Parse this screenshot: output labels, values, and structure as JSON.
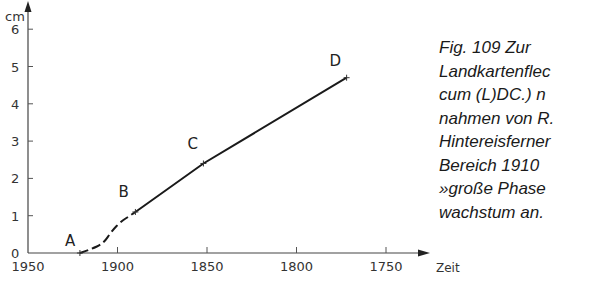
{
  "chart_data": {
    "type": "line",
    "title": "",
    "xlabel": "Zeit",
    "ylabel": "cm",
    "x_axis_reversed": true,
    "xlim": [
      1950,
      1725
    ],
    "ylim": [
      0,
      6.5
    ],
    "x_ticks": [
      1950,
      1900,
      1850,
      1800,
      1750
    ],
    "x_tick_labels": [
      "1950",
      "1900",
      "1850",
      "1800",
      "1750"
    ],
    "y_ticks": [
      0,
      1,
      2,
      3,
      4,
      5,
      6
    ],
    "y_tick_labels": [
      "0",
      "1",
      "2",
      "3",
      "4",
      "5",
      "6"
    ],
    "grid": false,
    "legend": null,
    "points": [
      {
        "label": "A",
        "x": 1921,
        "y": 0.0
      },
      {
        "label": "B",
        "x": 1890,
        "y": 1.1
      },
      {
        "label": "C",
        "x": 1852,
        "y": 2.4
      },
      {
        "label": "D",
        "x": 1772,
        "y": 4.7
      }
    ],
    "series": [
      {
        "name": "dashed segment A-B",
        "style": "dashed",
        "x": [
          1921,
          1915,
          1908,
          1903,
          1898,
          1893,
          1890
        ],
        "y": [
          0.0,
          0.1,
          0.25,
          0.6,
          0.85,
          1.0,
          1.1
        ]
      },
      {
        "name": "solid segment B-D",
        "style": "solid",
        "x": [
          1890,
          1852,
          1772
        ],
        "y": [
          1.1,
          2.4,
          4.7
        ]
      }
    ]
  },
  "axes": {
    "y_unit": "cm",
    "x_label": "Zeit"
  },
  "caption": {
    "lines": [
      "Fig. 109    Zur",
      "Landkartenflec",
      "cum (L)DC.) n",
      "nahmen von R.",
      "Hintereisferner",
      "Bereich   1910",
      "»große Phase",
      "wachstum an."
    ]
  },
  "colors": {
    "line": "#1a1a1a",
    "axis": "#444444",
    "background": "#ffffff"
  }
}
